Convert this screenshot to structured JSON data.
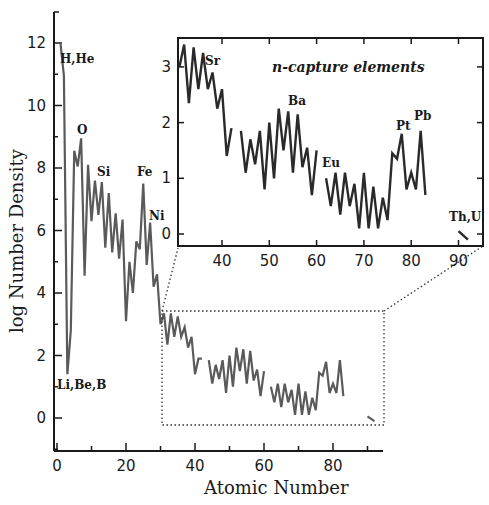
{
  "chart_data": [
    {
      "type": "line",
      "title": "",
      "xlabel": "Atomic Number",
      "ylabel": "log Number Density",
      "xlim": [
        0,
        95
      ],
      "ylim": [
        -1,
        13
      ],
      "x_ticks": [
        0,
        20,
        40,
        60,
        80
      ],
      "y_ticks": [
        0,
        2,
        4,
        6,
        8,
        10,
        12
      ],
      "grid": false,
      "line_color": "#5a5a5a",
      "series": [
        {
          "name": "solar abundances",
          "segments": [
            {
              "x": [
                1,
                2,
                3,
                4,
                5,
                6,
                7,
                8,
                9,
                10,
                11,
                12,
                13,
                14,
                15,
                16,
                17,
                18,
                19,
                20,
                21,
                22,
                23,
                24,
                25,
                26,
                27,
                28,
                29,
                30,
                31,
                32,
                33,
                34,
                35,
                36,
                37,
                38,
                39,
                40,
                41,
                42
              ],
              "y": [
                12.0,
                10.95,
                1.4,
                2.8,
                8.55,
                8.05,
                8.95,
                4.55,
                8.1,
                6.3,
                7.6,
                6.5,
                7.55,
                5.45,
                7.2,
                5.3,
                6.55,
                5.1,
                6.35,
                3.1,
                5.0,
                4.0,
                5.65,
                5.4,
                7.5,
                4.9,
                6.25,
                4.2,
                4.6,
                3.0,
                3.35,
                2.35,
                3.35,
                2.6,
                3.25,
                2.6,
                2.9,
                2.25,
                2.6,
                1.4,
                1.9,
                1.9
              ]
            },
            {
              "x": [
                44,
                45,
                46,
                47,
                48,
                49,
                50,
                51,
                52,
                53,
                54,
                55,
                56,
                57,
                58,
                59,
                60
              ],
              "y": [
                1.85,
                1.1,
                1.7,
                1.25,
                1.85,
                0.8,
                2.0,
                1.0,
                2.25,
                1.5,
                2.2,
                1.1,
                2.15,
                1.2,
                1.55,
                0.7,
                1.5
              ]
            },
            {
              "x": [
                62,
                63,
                64,
                65,
                66,
                67,
                68,
                69,
                70,
                71,
                72,
                73,
                74,
                75,
                76,
                77,
                78,
                79,
                80,
                81,
                82,
                83
              ],
              "y": [
                1.0,
                0.5,
                1.1,
                0.35,
                1.1,
                0.5,
                0.9,
                0.1,
                1.1,
                0.1,
                0.85,
                0.1,
                0.65,
                0.25,
                1.45,
                1.35,
                1.8,
                0.8,
                1.1,
                0.8,
                1.85,
                0.7
              ]
            },
            {
              "x": [
                90,
                92
              ],
              "y": [
                0.05,
                -0.1
              ]
            }
          ]
        }
      ],
      "annotations": [
        {
          "text": "H,He",
          "x": 1.5,
          "y": 11.2
        },
        {
          "text": "Li,Be,B",
          "x": 0,
          "y": 1.0
        },
        {
          "text": "O",
          "x": 8,
          "y": 9.2
        },
        {
          "text": "Si",
          "x": 14,
          "y": 7.8
        },
        {
          "text": "Fe",
          "x": 26,
          "y": 7.8
        },
        {
          "text": "Ni",
          "x": 28,
          "y": 6.7
        }
      ],
      "zoom_box": {
        "x": [
          31,
          94
        ],
        "y": [
          -0.4,
          3.4
        ],
        "style": "dotted"
      }
    },
    {
      "type": "line",
      "title": "n-capture elements",
      "xlabel": "",
      "ylabel": "",
      "xlim": [
        31,
        95
      ],
      "ylim": [
        -0.2,
        3.5
      ],
      "x_ticks": [
        40,
        50,
        60,
        70,
        80,
        90
      ],
      "y_ticks": [
        0,
        1,
        2,
        3
      ],
      "grid": false,
      "line_color": "#2a2a2a",
      "series": [
        {
          "name": "n-capture abundances",
          "segments": [
            {
              "x": [
                31,
                32,
                33,
                34,
                35,
                36,
                37,
                38,
                39,
                40,
                41,
                42
              ],
              "y": [
                3.0,
                3.4,
                2.35,
                3.35,
                2.6,
                3.25,
                2.6,
                2.9,
                2.25,
                2.6,
                1.4,
                1.9
              ]
            },
            {
              "x": [
                44,
                45,
                46,
                47,
                48,
                49,
                50,
                51,
                52,
                53,
                54,
                55,
                56,
                57,
                58,
                59,
                60
              ],
              "y": [
                1.85,
                1.1,
                1.7,
                1.25,
                1.85,
                0.8,
                2.0,
                1.0,
                2.25,
                1.5,
                2.2,
                1.1,
                2.15,
                1.2,
                1.55,
                0.7,
                1.5
              ]
            },
            {
              "x": [
                62,
                63,
                64,
                65,
                66,
                67,
                68,
                69,
                70,
                71,
                72,
                73,
                74,
                75,
                76,
                77,
                78,
                79,
                80,
                81,
                82,
                83
              ],
              "y": [
                1.0,
                0.5,
                1.1,
                0.35,
                1.1,
                0.5,
                0.9,
                0.1,
                1.1,
                0.1,
                0.85,
                0.1,
                0.65,
                0.25,
                1.45,
                1.35,
                1.8,
                0.8,
                1.1,
                0.8,
                1.85,
                0.7
              ]
            },
            {
              "x": [
                90,
                92
              ],
              "y": [
                0.05,
                -0.1
              ]
            }
          ]
        }
      ],
      "annotations": [
        {
          "text": "Sr",
          "x": 38,
          "y": 3.05
        },
        {
          "text": "Ba",
          "x": 55,
          "y": 2.3
        },
        {
          "text": "Eu",
          "x": 63,
          "y": 1.1
        },
        {
          "text": "Pt",
          "x": 77.5,
          "y": 1.9
        },
        {
          "text": "Pb",
          "x": 81.5,
          "y": 2.1
        },
        {
          "text": "Th,U",
          "x": 91,
          "y": 0.2
        }
      ]
    }
  ],
  "labels": {
    "xlabel": "Atomic Number",
    "ylabel": "log Number Density",
    "inset_title": "n-capture elements",
    "main_x_ticks": [
      "0",
      "20",
      "40",
      "60",
      "80"
    ],
    "main_y_ticks": [
      "0",
      "2",
      "4",
      "6",
      "8",
      "10",
      "12"
    ],
    "inset_x_ticks": [
      "40",
      "50",
      "60",
      "70",
      "80",
      "90"
    ],
    "inset_y_ticks": [
      "0",
      "1",
      "2",
      "3"
    ],
    "annot": {
      "hhe": "H,He",
      "libeb": "Li,Be,B",
      "o": "O",
      "si": "Si",
      "fe": "Fe",
      "ni": "Ni",
      "sr": "Sr",
      "ba": "Ba",
      "eu": "Eu",
      "pt": "Pt",
      "pb": "Pb",
      "thu": "Th,U"
    }
  }
}
